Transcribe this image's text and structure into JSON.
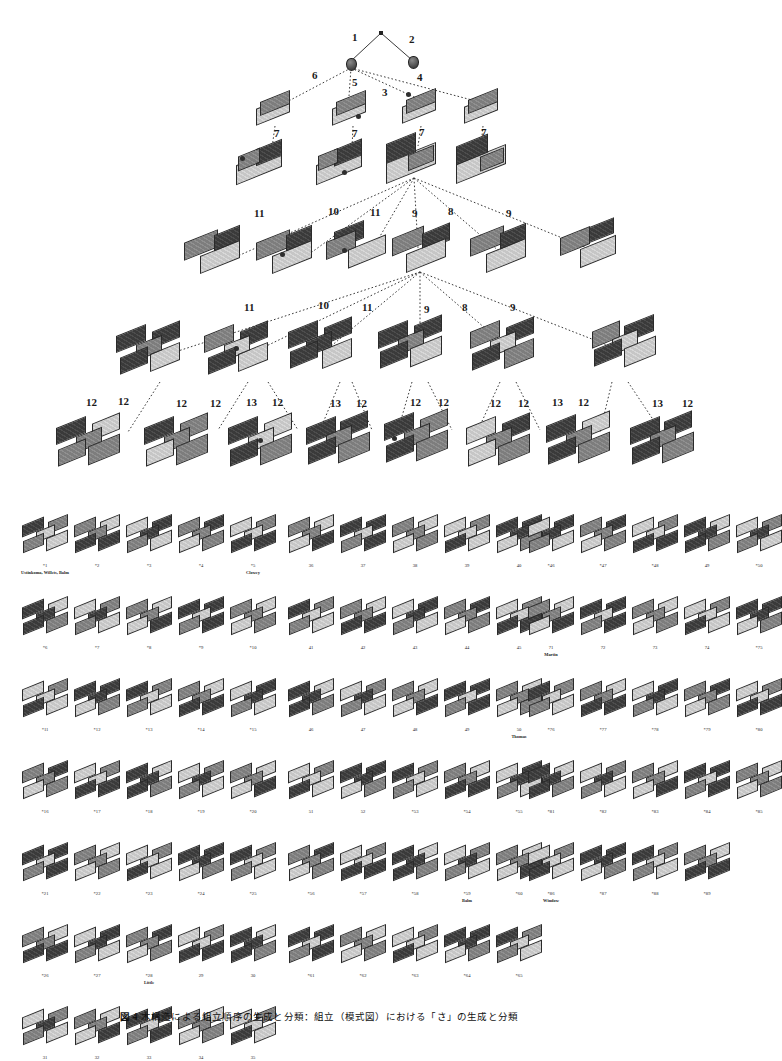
{
  "figure": {
    "caption_number": "図 4",
    "caption_text": "木構造による組立順序の生成と分類：組立（模式図）における「さ」の生成と分類",
    "caption_full": "図 4　木構造による組立順序の生成と分類（模式図）における「さ」の生成と分類"
  },
  "tree": {
    "root_marker": "*",
    "levels": [
      {
        "level": 0,
        "name": "root",
        "nodes": [
          {
            "id": "r",
            "kind": "dot"
          }
        ]
      },
      {
        "level": 1,
        "name": "single-element",
        "nodes": [
          {
            "id": "n1",
            "kind": "nub",
            "edge_label": "1"
          },
          {
            "id": "n2",
            "kind": "nub",
            "edge_label": "2"
          }
        ]
      },
      {
        "level": 2,
        "name": "two-element",
        "edge_labels": [
          "6",
          "5",
          "3",
          "4"
        ],
        "nodes": [
          {
            "id": "b1",
            "kind": "slab",
            "child_label": "7"
          },
          {
            "id": "b2",
            "kind": "slab",
            "child_label": "7"
          },
          {
            "id": "b3",
            "kind": "slab",
            "child_label": "7"
          },
          {
            "id": "b4",
            "kind": "slab",
            "child_label": "7"
          }
        ]
      },
      {
        "level": 3,
        "name": "three-element",
        "edge_labels": [
          "7",
          "7",
          "7",
          "7"
        ],
        "nodes": [
          {
            "id": "c1",
            "kind": "pair"
          },
          {
            "id": "c2",
            "kind": "pair"
          },
          {
            "id": "c3",
            "kind": "pair"
          },
          {
            "id": "c4",
            "kind": "pair"
          }
        ]
      },
      {
        "level": 4,
        "name": "four-element",
        "edge_labels": [
          "11",
          "10",
          "11",
          "9",
          "8",
          "9"
        ],
        "nodes": [
          {
            "id": "d1",
            "kind": "ell"
          },
          {
            "id": "d2",
            "kind": "ell"
          },
          {
            "id": "d3",
            "kind": "ell"
          },
          {
            "id": "d4",
            "kind": "ell"
          },
          {
            "id": "d5",
            "kind": "ell"
          },
          {
            "id": "d6",
            "kind": "ell"
          }
        ]
      },
      {
        "level": 5,
        "name": "five-element",
        "edge_labels": [
          "11",
          "10",
          "11",
          "9",
          "8",
          "9"
        ],
        "nodes": [
          {
            "id": "e1",
            "kind": "cross"
          },
          {
            "id": "e2",
            "kind": "cross"
          },
          {
            "id": "e3",
            "kind": "cross"
          },
          {
            "id": "e4",
            "kind": "cross"
          },
          {
            "id": "e5",
            "kind": "cross"
          },
          {
            "id": "e6",
            "kind": "cross"
          }
        ]
      },
      {
        "level": 6,
        "name": "six-element-leaves",
        "edge_labels": [
          "12",
          "12",
          "12",
          "12",
          "13",
          "12",
          "13",
          "12",
          "12",
          "12",
          "12",
          "12",
          "13",
          "12",
          "13",
          "12"
        ],
        "nodes": [
          {
            "id": "f1",
            "kind": "cross"
          },
          {
            "id": "f2",
            "kind": "cross"
          },
          {
            "id": "f3",
            "kind": "cross"
          },
          {
            "id": "f4",
            "kind": "cross"
          },
          {
            "id": "f5",
            "kind": "cross"
          },
          {
            "id": "f6",
            "kind": "cross"
          },
          {
            "id": "f7",
            "kind": "cross"
          },
          {
            "id": "f8",
            "kind": "cross"
          }
        ]
      }
    ]
  },
  "catalog": {
    "columns": [
      {
        "name": "column-left",
        "rows": [
          {
            "items": [
              {
                "label": "*1",
                "name": "Ustinkoma, Willets, Balm"
              },
              {
                "label": "*2",
                "name": ""
              },
              {
                "label": "*3",
                "name": ""
              },
              {
                "label": "*4",
                "name": ""
              },
              {
                "label": "*5",
                "name": "Clowey"
              }
            ]
          },
          {
            "items": [
              {
                "label": "*6",
                "name": ""
              },
              {
                "label": "*7",
                "name": ""
              },
              {
                "label": "*8",
                "name": ""
              },
              {
                "label": "*9",
                "name": ""
              },
              {
                "label": "*10",
                "name": ""
              }
            ]
          },
          {
            "items": [
              {
                "label": "*11",
                "name": ""
              },
              {
                "label": "*12",
                "name": ""
              },
              {
                "label": "*13",
                "name": ""
              },
              {
                "label": "*14",
                "name": ""
              },
              {
                "label": "*15",
                "name": ""
              }
            ]
          },
          {
            "items": [
              {
                "label": "*16",
                "name": ""
              },
              {
                "label": "*17",
                "name": ""
              },
              {
                "label": "*18",
                "name": ""
              },
              {
                "label": "*19",
                "name": ""
              },
              {
                "label": "*20",
                "name": ""
              }
            ]
          },
          {
            "items": [
              {
                "label": "*21",
                "name": ""
              },
              {
                "label": "*22",
                "name": ""
              },
              {
                "label": "*23",
                "name": ""
              },
              {
                "label": "*24",
                "name": ""
              },
              {
                "label": "*25",
                "name": ""
              }
            ]
          },
          {
            "items": [
              {
                "label": "*26",
                "name": ""
              },
              {
                "label": "*27",
                "name": ""
              },
              {
                "label": "*28",
                "name": "Little"
              },
              {
                "label": "29",
                "name": ""
              },
              {
                "label": "30",
                "name": ""
              }
            ]
          },
          {
            "items": [
              {
                "label": "31",
                "name": ""
              },
              {
                "label": "32",
                "name": ""
              },
              {
                "label": "33",
                "name": ""
              },
              {
                "label": "34",
                "name": ""
              },
              {
                "label": "35",
                "name": ""
              }
            ]
          }
        ]
      },
      {
        "name": "column-middle",
        "rows": [
          {
            "items": [
              {
                "label": "36",
                "name": ""
              },
              {
                "label": "37",
                "name": ""
              },
              {
                "label": "38",
                "name": ""
              },
              {
                "label": "39",
                "name": ""
              },
              {
                "label": "40",
                "name": ""
              }
            ]
          },
          {
            "items": [
              {
                "label": "41",
                "name": ""
              },
              {
                "label": "42",
                "name": ""
              },
              {
                "label": "43",
                "name": ""
              },
              {
                "label": "44",
                "name": ""
              },
              {
                "label": "45",
                "name": ""
              }
            ]
          },
          {
            "items": [
              {
                "label": "46",
                "name": ""
              },
              {
                "label": "47",
                "name": ""
              },
              {
                "label": "48",
                "name": ""
              },
              {
                "label": "49",
                "name": ""
              },
              {
                "label": "50",
                "name": "Thomas"
              }
            ]
          },
          {
            "items": [
              {
                "label": "51",
                "name": ""
              },
              {
                "label": "52",
                "name": ""
              },
              {
                "label": "*53",
                "name": ""
              },
              {
                "label": "*54",
                "name": ""
              },
              {
                "label": "*55",
                "name": ""
              }
            ]
          },
          {
            "items": [
              {
                "label": "*56",
                "name": ""
              },
              {
                "label": "*57",
                "name": ""
              },
              {
                "label": "*58",
                "name": ""
              },
              {
                "label": "*59",
                "name": "Balm"
              },
              {
                "label": "*60",
                "name": ""
              }
            ]
          },
          {
            "items": [
              {
                "label": "*61",
                "name": ""
              },
              {
                "label": "*62",
                "name": ""
              },
              {
                "label": "*63",
                "name": ""
              },
              {
                "label": "*64",
                "name": ""
              },
              {
                "label": "*65",
                "name": ""
              }
            ]
          }
        ]
      },
      {
        "name": "column-right",
        "rows": [
          {
            "items": [
              {
                "label": "*46",
                "name": ""
              },
              {
                "label": "*47",
                "name": ""
              },
              {
                "label": "*48",
                "name": ""
              },
              {
                "label": "49",
                "name": ""
              },
              {
                "label": "*50",
                "name": ""
              }
            ]
          },
          {
            "items": [
              {
                "label": "71",
                "name": "Martin"
              },
              {
                "label": "72",
                "name": ""
              },
              {
                "label": "73",
                "name": ""
              },
              {
                "label": "74",
                "name": ""
              },
              {
                "label": "*75",
                "name": ""
              }
            ]
          },
          {
            "items": [
              {
                "label": "*76",
                "name": ""
              },
              {
                "label": "*77",
                "name": ""
              },
              {
                "label": "*78",
                "name": ""
              },
              {
                "label": "*79",
                "name": ""
              },
              {
                "label": "*80",
                "name": ""
              }
            ]
          },
          {
            "items": [
              {
                "label": "*81",
                "name": ""
              },
              {
                "label": "*82",
                "name": ""
              },
              {
                "label": "*83",
                "name": ""
              },
              {
                "label": "*84",
                "name": ""
              },
              {
                "label": "*85",
                "name": ""
              }
            ]
          },
          {
            "items": [
              {
                "label": "*86",
                "name": "Window"
              },
              {
                "label": "*87",
                "name": ""
              },
              {
                "label": "*88",
                "name": ""
              },
              {
                "label": "*89",
                "name": ""
              },
              {
                "label": "",
                "name": ""
              }
            ]
          }
        ]
      }
    ]
  },
  "colors": {
    "dark": "#3f3f3f",
    "mid": "#878787",
    "light": "#cfcfcf",
    "outline": "#2a2a2a",
    "paper": "#ffffff"
  }
}
